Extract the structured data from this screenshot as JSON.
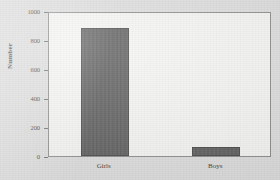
{
  "chart_data": {
    "type": "bar",
    "title": "",
    "subtitle": "",
    "xlabel": "",
    "ylabel": "Number",
    "categories": [
      "Girls",
      "Boys"
    ],
    "values": [
      880,
      65
    ],
    "series": [
      {
        "name": "Number",
        "values": [
          880,
          65
        ]
      }
    ],
    "ylim": [
      0,
      1000
    ],
    "y_ticks": [
      0,
      200,
      400,
      600,
      800,
      1000
    ],
    "y_tick_labels": [
      "0",
      "200",
      "400",
      "600",
      "800",
      "1000"
    ],
    "grid": false,
    "legend": false,
    "legend_position": "none",
    "annotations": []
  },
  "style": {
    "bar_color": "#5f5f5f",
    "bar_edge_color": "#4a4a4a",
    "plot_background": "#f6f6f4",
    "page_background": "#dedede",
    "axis_color": "#8d8d8d",
    "text_color": "#3c3c3c"
  }
}
